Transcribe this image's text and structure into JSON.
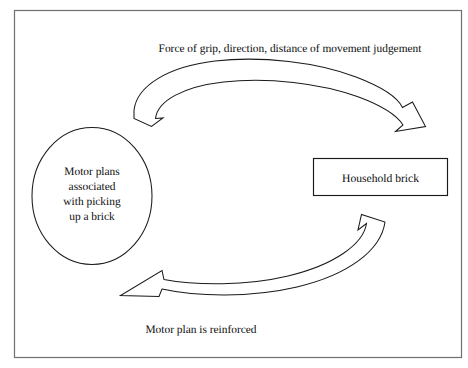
{
  "diagram": {
    "type": "cycle-diagram",
    "border_color": "#6f6f6f",
    "outline_color": "#1a1a1a",
    "background_color": "#ffffff",
    "text_color": "#0d0d0d",
    "nodes": [
      {
        "id": "motor-plans-ellipse",
        "shape": "ellipse",
        "lines": [
          "Motor plans",
          "associated",
          "with picking",
          "up a brick"
        ]
      },
      {
        "id": "household-brick-box",
        "shape": "rectangle",
        "label": "Household brick"
      }
    ],
    "arrows": [
      {
        "id": "top-arrow",
        "direction": "left-to-right",
        "style": "curved-block-arrow",
        "caption": "Force of grip, direction, distance of movement judgement"
      },
      {
        "id": "bottom-arrow",
        "direction": "right-to-left",
        "style": "curved-block-arrow",
        "caption": "Motor plan is reinforced"
      }
    ]
  }
}
